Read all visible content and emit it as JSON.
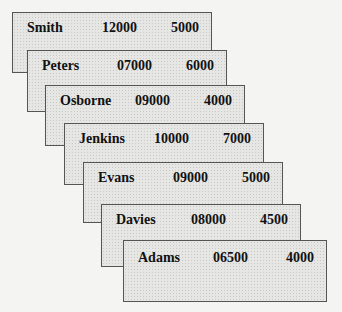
{
  "records": [
    {
      "name": "Smith",
      "value1": "12000",
      "value2": "5000"
    },
    {
      "name": "Peters",
      "value1": "07000",
      "value2": "6000"
    },
    {
      "name": "Osborne",
      "value1": "09000",
      "value2": "4000"
    },
    {
      "name": "Jenkins",
      "value1": "10000",
      "value2": "7000"
    },
    {
      "name": "Evans",
      "value1": "09000",
      "value2": "5000"
    },
    {
      "name": "Davies",
      "value1": "08000",
      "value2": "4500"
    },
    {
      "name": "Adams",
      "value1": "06500",
      "value2": "4000"
    }
  ]
}
